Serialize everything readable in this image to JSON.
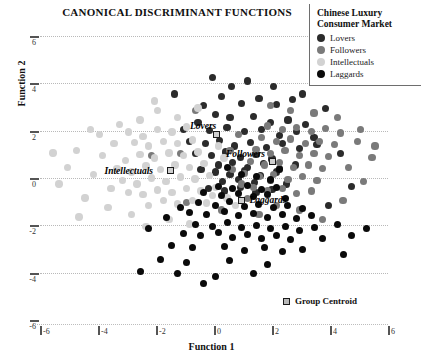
{
  "chart_data": {
    "type": "scatter",
    "title": "CANONICAL DISCRIMINANT FUNCTIONS",
    "xlabel": "Function 1",
    "ylabel": "Function 2",
    "xlim": [
      -6,
      6
    ],
    "ylim": [
      -6,
      6
    ],
    "xticks": [
      "-6",
      "-4",
      "-2",
      "0",
      "2",
      "4",
      "6"
    ],
    "yticks": [
      "6",
      "4",
      "2",
      "0",
      "-2",
      "-4",
      "-6"
    ],
    "grid": "horizontal-dotted",
    "legend_position": "top-right",
    "legend": {
      "title_line1": "Chinese Luxury",
      "title_line2": "Consumer Market",
      "entries": [
        {
          "label": "Lovers",
          "color": "#2b2b2b"
        },
        {
          "label": "Followers",
          "color": "#7a7a7a"
        },
        {
          "label": "Intellectuals",
          "color": "#d2d2d2"
        },
        {
          "label": "Laggards",
          "color": "#0a0a0a"
        }
      ]
    },
    "centroid_legend_label": "Group Centroid",
    "centroids": [
      {
        "group": "Lovers",
        "label": "Lovers",
        "x": 0.1,
        "y": 1.85
      },
      {
        "group": "Followers",
        "label": "Followers",
        "x": 2.0,
        "y": 0.7
      },
      {
        "group": "Intellectuals",
        "label": "Intellectuals",
        "x": -1.5,
        "y": 0.3
      },
      {
        "group": "Laggards",
        "label": "Laggards",
        "x": 0.95,
        "y": -0.95
      }
    ],
    "series": [
      {
        "name": "Lovers",
        "color": "#2b2b2b",
        "points": [
          [
            0.25,
            3.45
          ],
          [
            -0.35,
            3.05
          ],
          [
            0.95,
            3.15
          ],
          [
            1.55,
            3.35
          ],
          [
            2.15,
            3.1
          ],
          [
            2.7,
            3.3
          ],
          [
            0.05,
            2.7
          ],
          [
            0.55,
            2.55
          ],
          [
            1.35,
            2.6
          ],
          [
            1.95,
            2.35
          ],
          [
            2.55,
            2.45
          ],
          [
            3.15,
            2.25
          ],
          [
            -0.55,
            2.35
          ],
          [
            -1.05,
            2.05
          ],
          [
            -0.15,
            2.0
          ],
          [
            0.45,
            2.15
          ],
          [
            1.05,
            1.95
          ],
          [
            1.65,
            2.05
          ],
          [
            2.25,
            1.8
          ],
          [
            2.85,
            1.95
          ],
          [
            3.45,
            1.7
          ],
          [
            -0.85,
            1.55
          ],
          [
            -0.3,
            1.45
          ],
          [
            0.2,
            1.6
          ],
          [
            0.7,
            1.35
          ],
          [
            1.25,
            1.5
          ],
          [
            1.8,
            1.3
          ],
          [
            2.35,
            1.45
          ],
          [
            2.95,
            1.25
          ],
          [
            3.55,
            1.4
          ],
          [
            -0.65,
            1.05
          ],
          [
            -0.1,
            0.95
          ],
          [
            0.4,
            1.1
          ],
          [
            0.9,
            0.85
          ],
          [
            1.45,
            1.0
          ],
          [
            2.0,
            0.8
          ],
          [
            0.15,
            0.55
          ],
          [
            0.65,
            0.65
          ],
          [
            1.15,
            0.45
          ],
          [
            1.7,
            0.6
          ],
          [
            2.25,
            0.4
          ],
          [
            2.8,
            0.55
          ],
          [
            -0.45,
            0.35
          ],
          [
            0.05,
            0.25
          ],
          [
            0.55,
            0.15
          ],
          [
            1.05,
            0.3
          ],
          [
            1.6,
            0.1
          ],
          [
            2.15,
            0.25
          ],
          [
            0.3,
            -0.15
          ],
          [
            0.85,
            -0.05
          ],
          [
            1.4,
            -0.2
          ],
          [
            1.95,
            -0.1
          ],
          [
            2.5,
            -0.25
          ],
          [
            -0.2,
            -0.45
          ],
          [
            0.35,
            -0.55
          ],
          [
            0.9,
            -0.4
          ],
          [
            1.45,
            -0.6
          ],
          [
            2.0,
            -0.5
          ],
          [
            3.85,
            2.95
          ],
          [
            4.35,
            1.05
          ],
          [
            4.75,
            -0.35
          ],
          [
            -1.35,
            3.55
          ],
          [
            3.95,
            -1.15
          ],
          [
            0.6,
            3.85
          ],
          [
            1.15,
            4.1
          ],
          [
            -0.05,
            4.25
          ],
          [
            2.05,
            3.85
          ],
          [
            3.05,
            3.55
          ]
        ]
      },
      {
        "name": "Followers",
        "color": "#7a7a7a",
        "points": [
          [
            1.85,
            2.2
          ],
          [
            2.35,
            2.05
          ],
          [
            2.85,
            2.15
          ],
          [
            3.35,
            1.95
          ],
          [
            3.85,
            2.1
          ],
          [
            4.35,
            1.9
          ],
          [
            1.65,
            1.7
          ],
          [
            2.15,
            1.55
          ],
          [
            2.65,
            1.65
          ],
          [
            3.15,
            1.45
          ],
          [
            3.65,
            1.55
          ],
          [
            4.15,
            1.4
          ],
          [
            1.45,
            1.2
          ],
          [
            1.95,
            1.05
          ],
          [
            2.45,
            1.15
          ],
          [
            2.95,
            0.95
          ],
          [
            3.45,
            1.05
          ],
          [
            3.95,
            0.9
          ],
          [
            1.25,
            0.7
          ],
          [
            1.75,
            0.55
          ],
          [
            2.25,
            0.65
          ],
          [
            2.75,
            0.45
          ],
          [
            3.25,
            0.55
          ],
          [
            3.75,
            0.4
          ],
          [
            1.05,
            0.2
          ],
          [
            1.55,
            0.05
          ],
          [
            2.05,
            0.15
          ],
          [
            2.55,
            -0.05
          ],
          [
            3.05,
            0.05
          ],
          [
            3.55,
            -0.1
          ],
          [
            1.35,
            -0.4
          ],
          [
            1.85,
            -0.55
          ],
          [
            2.35,
            -0.45
          ],
          [
            2.85,
            -0.65
          ],
          [
            3.35,
            -0.55
          ],
          [
            4.65,
            0.45
          ],
          [
            5.15,
            -0.15
          ],
          [
            4.95,
            1.55
          ],
          [
            5.45,
            0.85
          ],
          [
            4.45,
            -0.95
          ],
          [
            0.85,
            1.85
          ],
          [
            0.55,
            1.15
          ],
          [
            0.65,
            0.35
          ],
          [
            0.95,
            -0.25
          ],
          [
            1.15,
            -0.85
          ],
          [
            2.15,
            -1.15
          ],
          [
            2.95,
            -1.35
          ],
          [
            1.55,
            -1.55
          ],
          [
            3.75,
            -1.75
          ],
          [
            4.25,
            2.55
          ],
          [
            3.45,
            2.75
          ],
          [
            2.65,
            2.85
          ],
          [
            1.95,
            3.05
          ],
          [
            5.05,
            2.05
          ],
          [
            5.55,
            1.35
          ],
          [
            -0.65,
            2.85
          ],
          [
            -1.15,
            1.05
          ],
          [
            -2.15,
            0.95
          ],
          [
            -0.95,
            -1.05
          ],
          [
            0.25,
            -1.35
          ]
        ]
      },
      {
        "name": "Intellectuals",
        "color": "#d2d2d2",
        "points": [
          [
            -1.95,
            2.05
          ],
          [
            -1.45,
            1.95
          ],
          [
            -0.95,
            2.15
          ],
          [
            -2.45,
            1.75
          ],
          [
            -2.95,
            1.95
          ],
          [
            -1.75,
            1.55
          ],
          [
            -1.25,
            1.45
          ],
          [
            -0.75,
            1.6
          ],
          [
            -2.25,
            1.35
          ],
          [
            -2.75,
            1.5
          ],
          [
            -1.55,
            1.05
          ],
          [
            -1.05,
            0.95
          ],
          [
            -0.55,
            1.1
          ],
          [
            -2.05,
            0.85
          ],
          [
            -2.55,
            1.0
          ],
          [
            -3.05,
            0.75
          ],
          [
            -1.35,
            0.55
          ],
          [
            -0.85,
            0.45
          ],
          [
            -0.35,
            0.6
          ],
          [
            -1.85,
            0.35
          ],
          [
            -2.35,
            0.5
          ],
          [
            -2.85,
            0.25
          ],
          [
            -3.35,
            0.4
          ],
          [
            -1.15,
            0.05
          ],
          [
            -0.65,
            -0.05
          ],
          [
            -0.15,
            0.1
          ],
          [
            -1.65,
            -0.15
          ],
          [
            -2.15,
            0.0
          ],
          [
            -2.65,
            -0.25
          ],
          [
            -3.15,
            -0.1
          ],
          [
            -0.95,
            -0.45
          ],
          [
            -0.45,
            -0.55
          ],
          [
            0.05,
            -0.4
          ],
          [
            -1.45,
            -0.6
          ],
          [
            -1.95,
            -0.5
          ],
          [
            -2.45,
            -0.7
          ],
          [
            -2.95,
            -0.6
          ],
          [
            -0.75,
            -0.95
          ],
          [
            -0.25,
            -1.05
          ],
          [
            -1.25,
            -1.1
          ],
          [
            -1.75,
            -0.95
          ],
          [
            -2.25,
            -1.15
          ],
          [
            -3.55,
            -0.45
          ],
          [
            -3.85,
            0.95
          ],
          [
            -4.15,
            0.15
          ],
          [
            -4.45,
            -0.85
          ],
          [
            -3.45,
            1.45
          ],
          [
            -3.95,
            1.85
          ],
          [
            -4.75,
            1.15
          ],
          [
            -2.55,
            2.45
          ],
          [
            -1.95,
            2.85
          ],
          [
            -1.25,
            2.55
          ],
          [
            -0.55,
            2.95
          ],
          [
            -3.25,
            2.25
          ],
          [
            -2.05,
            3.25
          ],
          [
            -5.05,
            0.45
          ],
          [
            -5.35,
            -0.25
          ],
          [
            -4.25,
            2.05
          ],
          [
            -3.65,
            -1.25
          ],
          [
            -2.85,
            -1.55
          ],
          [
            -1.55,
            -1.75
          ],
          [
            -0.85,
            -1.95
          ],
          [
            0.35,
            0.85
          ],
          [
            0.15,
            1.35
          ],
          [
            -0.05,
            -0.75
          ],
          [
            0.45,
            -0.85
          ],
          [
            0.75,
            -1.15
          ],
          [
            -5.55,
            1.05
          ],
          [
            -4.65,
            -1.65
          ],
          [
            -2.35,
            -2.05
          ]
        ]
      },
      {
        "name": "Laggards",
        "color": "#0a0a0a",
        "points": [
          [
            0.15,
            -0.35
          ],
          [
            0.65,
            -0.45
          ],
          [
            1.15,
            -0.3
          ],
          [
            1.65,
            -0.5
          ],
          [
            2.15,
            -0.4
          ],
          [
            -0.35,
            -0.6
          ],
          [
            0.25,
            -0.75
          ],
          [
            0.85,
            -0.65
          ],
          [
            1.35,
            -0.8
          ],
          [
            1.85,
            -0.7
          ],
          [
            2.45,
            -0.85
          ],
          [
            -0.55,
            -1.05
          ],
          [
            0.05,
            -1.15
          ],
          [
            0.55,
            -1.0
          ],
          [
            1.05,
            -1.2
          ],
          [
            1.55,
            -1.1
          ],
          [
            2.05,
            -1.25
          ],
          [
            2.55,
            -1.15
          ],
          [
            3.05,
            -1.3
          ],
          [
            -0.85,
            -1.45
          ],
          [
            -0.25,
            -1.55
          ],
          [
            0.35,
            -1.4
          ],
          [
            0.85,
            -1.6
          ],
          [
            1.35,
            -1.5
          ],
          [
            1.85,
            -1.65
          ],
          [
            2.35,
            -1.55
          ],
          [
            2.85,
            -1.7
          ],
          [
            3.35,
            -1.6
          ],
          [
            -0.65,
            -1.95
          ],
          [
            -0.05,
            -2.05
          ],
          [
            0.45,
            -1.9
          ],
          [
            0.95,
            -2.1
          ],
          [
            1.45,
            -2.0
          ],
          [
            1.95,
            -2.15
          ],
          [
            2.45,
            -2.05
          ],
          [
            2.95,
            -2.2
          ],
          [
            3.45,
            -2.1
          ],
          [
            -1.05,
            -2.35
          ],
          [
            -0.45,
            -2.45
          ],
          [
            0.15,
            -2.3
          ],
          [
            0.65,
            -2.5
          ],
          [
            1.15,
            -2.4
          ],
          [
            1.65,
            -2.55
          ],
          [
            2.15,
            -2.45
          ],
          [
            2.65,
            -2.6
          ],
          [
            -1.45,
            -2.85
          ],
          [
            -0.75,
            -2.95
          ],
          [
            0.35,
            -2.9
          ],
          [
            1.05,
            -3.05
          ],
          [
            1.75,
            -2.95
          ],
          [
            2.35,
            -3.1
          ],
          [
            3.05,
            -3.0
          ],
          [
            -1.85,
            -3.45
          ],
          [
            -0.95,
            -3.55
          ],
          [
            0.55,
            -3.5
          ],
          [
            1.85,
            -3.65
          ],
          [
            3.75,
            -2.55
          ],
          [
            4.25,
            -1.95
          ],
          [
            4.75,
            -2.45
          ],
          [
            -1.25,
            -4.05
          ],
          [
            0.05,
            -4.15
          ],
          [
            1.35,
            -4.05
          ],
          [
            -2.25,
            -2.15
          ],
          [
            -1.65,
            -1.65
          ],
          [
            -1.15,
            -1.25
          ],
          [
            0.95,
            0.15
          ],
          [
            1.45,
            0.05
          ],
          [
            1.95,
            -0.05
          ],
          [
            2.25,
            0.35
          ],
          [
            0.45,
            0.45
          ],
          [
            5.25,
            -2.15
          ],
          [
            4.45,
            -3.25
          ],
          [
            -2.55,
            -3.95
          ],
          [
            -0.35,
            -4.45
          ]
        ]
      }
    ]
  }
}
